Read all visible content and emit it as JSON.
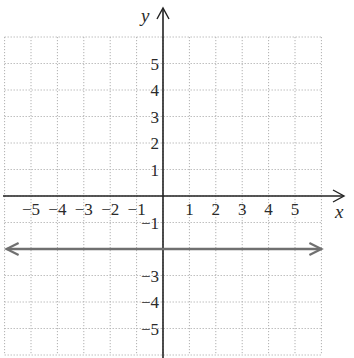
{
  "chart_data": {
    "type": "line",
    "title": "",
    "xlabel": "x",
    "ylabel": "y",
    "xlim": [
      -6,
      6
    ],
    "ylim": [
      -6,
      6
    ],
    "grid": true,
    "x_ticks": [
      -5,
      -4,
      -3,
      -2,
      -1,
      1,
      2,
      3,
      4,
      5
    ],
    "x_tick_labels": [
      "−5",
      "−4",
      "−3",
      "−2",
      "−1",
      "1",
      "2",
      "3",
      "4",
      "5"
    ],
    "y_ticks": [
      5,
      4,
      3,
      2,
      1,
      -1,
      -3,
      -4,
      -5
    ],
    "y_tick_labels": [
      "5",
      "4",
      "3",
      "2",
      "1",
      "−1",
      "−3",
      "−4",
      "−5"
    ],
    "series": [
      {
        "name": "y = -2",
        "equation": "y = -2",
        "x": [
          -6,
          6
        ],
        "y": [
          -2,
          -2
        ],
        "arrows": "both",
        "color": "#707070"
      }
    ]
  },
  "colors": {
    "axis": "#222222",
    "grid": "#b0b0b0",
    "line": "#707070"
  }
}
